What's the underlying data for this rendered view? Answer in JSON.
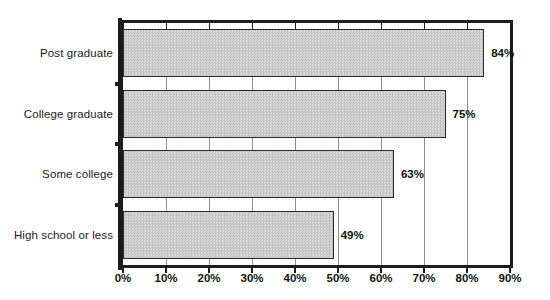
{
  "chart_data": {
    "type": "bar",
    "orientation": "horizontal",
    "title": "",
    "subtitle": "",
    "xlabel": "",
    "ylabel": "",
    "categories": [
      "Post graduate",
      "College graduate",
      "Some college",
      "High school or less"
    ],
    "values": [
      84,
      75,
      63,
      49
    ],
    "data_labels": [
      "84%",
      "75%",
      "63%",
      "49%"
    ],
    "xlim": [
      0,
      90
    ],
    "xtick_values": [
      0,
      10,
      20,
      30,
      40,
      50,
      60,
      70,
      80,
      90
    ],
    "xtick_labels": [
      "0%",
      "10%",
      "20%",
      "30%",
      "40%",
      "50%",
      "60%",
      "70%",
      "80%",
      "90%"
    ],
    "grid": true,
    "grid_axis": "x",
    "legend": false,
    "legend_position": "none",
    "bar_fill_color": "#d2d2d2",
    "bar_edge_color": "#2a2a2a",
    "axis_color": "#1c1c1c",
    "gridline_color": "#8e8e8e",
    "background_color": "#ffffff",
    "text_color": "#111111"
  }
}
